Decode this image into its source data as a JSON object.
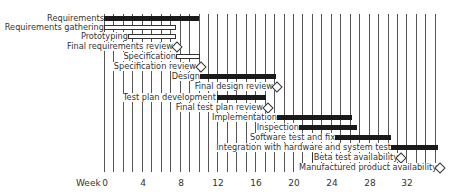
{
  "chart_data": {
    "type": "gantt",
    "title": "",
    "xlabel": "Week",
    "x_ticks": [
      0,
      4,
      8,
      12,
      16,
      20,
      24,
      28,
      32
    ],
    "xlim": [
      0,
      35.5
    ],
    "grid": true,
    "tasks": [
      {
        "name": "Requirements",
        "start": 0,
        "end": 10,
        "style": "summary"
      },
      {
        "name": "Requirements  gathering",
        "start": 0,
        "end": 7.5,
        "style": "task"
      },
      {
        "name": "Prototyping",
        "start": 2.5,
        "end": 7.5,
        "style": "task"
      },
      {
        "name": "Final requirements review",
        "at": 7.5,
        "style": "milestone"
      },
      {
        "name": "Specification",
        "start": 7.5,
        "end": 10,
        "style": "task"
      },
      {
        "name": "Specification review",
        "at": 10,
        "style": "milestone"
      },
      {
        "name": "Design",
        "start": 10,
        "end": 18,
        "style": "summary"
      },
      {
        "name": "Final design review",
        "at": 18,
        "style": "milestone"
      },
      {
        "name": "Test plan development",
        "start": 12,
        "end": 17,
        "style": "summary"
      },
      {
        "name": "Final test plan review",
        "at": 17,
        "style": "milestone"
      },
      {
        "name": "Implementation",
        "start": 18,
        "end": 26,
        "style": "summary"
      },
      {
        "name": "Inspection",
        "start": 20,
        "end": 26.5,
        "style": "summary"
      },
      {
        "name": "Software test and fix",
        "start": 24,
        "end": 30,
        "style": "summary"
      },
      {
        "name": "Integration with hardware and system test",
        "start": 30,
        "end": 35.3,
        "style": "summary"
      },
      {
        "name": "Beta test availability",
        "at": 31,
        "style": "milestone"
      },
      {
        "name": "Manufactured product availability",
        "at": 35.3,
        "style": "milestone"
      }
    ]
  },
  "axis": {
    "name": "Week",
    "ticks": [
      "0",
      "4",
      "8",
      "12",
      "16",
      "20",
      "24",
      "28",
      "32"
    ]
  },
  "labels": {
    "t0": "Requirements",
    "t1": "Requirements  gathering",
    "t2": "Prototyping",
    "t3": "Final requirements review",
    "t4": "Specification",
    "t5": "Specification review",
    "t6": "Design",
    "t7": "Final design review",
    "t8": "Test plan development",
    "t9": "Final test plan review",
    "t10": "Implementation",
    "t11": "Inspection",
    "t12": "Software test and fix",
    "t13": "Integration with hardware and system test",
    "t14": "Beta test availability",
    "t15": "Manufactured product availability"
  },
  "colors": {
    "bar_fill": "#1a1a1a",
    "grid": "#555555",
    "text": "#333333"
  }
}
